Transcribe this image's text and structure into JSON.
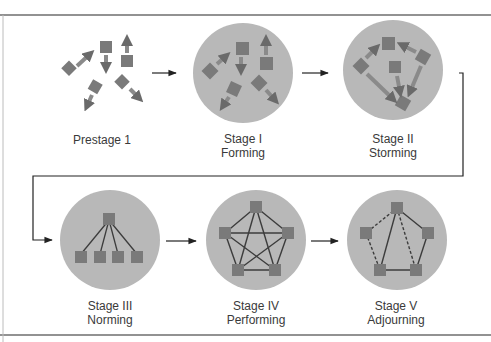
{
  "colors": {
    "circle": "#b8b8b8",
    "member": "#7a7a7a",
    "line": "#3c3c3c",
    "border": "#6e6e6e",
    "text": "#3a3a3a"
  },
  "stages": [
    {
      "id": "prestage",
      "line1": "Prestage 1",
      "line2": ""
    },
    {
      "id": "forming",
      "line1": "Stage I",
      "line2": "Forming"
    },
    {
      "id": "storming",
      "line1": "Stage II",
      "line2": "Storming"
    },
    {
      "id": "norming",
      "line1": "Stage III",
      "line2": "Norming"
    },
    {
      "id": "performing",
      "line1": "Stage IV",
      "line2": "Performing"
    },
    {
      "id": "adjourning",
      "line1": "Stage V",
      "line2": "Adjourning"
    }
  ]
}
